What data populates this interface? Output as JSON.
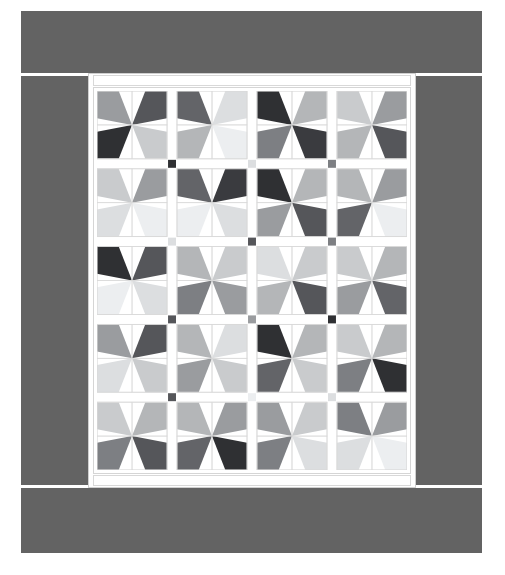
{
  "artwork": {
    "title": "Pinwheel Patchwork Quilt",
    "medium": "quilt photograph",
    "background_color": "#ffffff",
    "border_color": "#636363",
    "sashing_color": "#ffffff",
    "seam_line_color": "#d9d9d9",
    "frame_color": "#ffffff",
    "frame_line_color": "#d2d2d2"
  },
  "layout": {
    "canvas_width": 505,
    "canvas_height": 575,
    "border_strips": [
      {
        "name": "top",
        "x": 21,
        "y": 11,
        "w": 461,
        "h": 62
      },
      {
        "name": "left",
        "x": 21,
        "y": 76,
        "w": 67,
        "h": 409
      },
      {
        "name": "right",
        "x": 416,
        "y": 76,
        "w": 66,
        "h": 409
      },
      {
        "name": "bottom",
        "x": 21,
        "y": 488,
        "w": 461,
        "h": 65
      }
    ],
    "quilt_frame": {
      "x": 88,
      "y": 73,
      "w": 328,
      "h": 415
    },
    "blocks_across": 4,
    "blocks_down": 5,
    "units_per_block": 4,
    "sashing_width": 10,
    "cornerstone_size": 8
  },
  "palette": {
    "near_black": "#2f3033",
    "very_dark": "#3a3b3f",
    "dark": "#55565a",
    "dark_mid": "#636468",
    "mid": "#7d7f83",
    "mid_light": "#9a9c9f",
    "light": "#b4b6b8",
    "lighter": "#c9cbcd",
    "pale": "#dcdee0",
    "very_pale": "#eceef0",
    "white": "#ffffff"
  },
  "chart_data": {
    "type": "heatmap",
    "subtitle": "4 blocks across x 5 blocks down, 4 triangle units per block",
    "xlabel": "block column",
    "ylabel": "block row",
    "legend": [
      {
        "name": "near black",
        "hex": "#2f3033"
      },
      {
        "name": "very dark",
        "hex": "#3a3b3f"
      },
      {
        "name": "dark",
        "hex": "#55565a"
      },
      {
        "name": "dark mid",
        "hex": "#636468"
      },
      {
        "name": "mid",
        "hex": "#7d7f83"
      },
      {
        "name": "mid light",
        "hex": "#9a9c9f"
      },
      {
        "name": "light",
        "hex": "#b4b6b8"
      },
      {
        "name": "lighter",
        "hex": "#c9cbcd"
      },
      {
        "name": "pale",
        "hex": "#dcdee0"
      },
      {
        "name": "very pale",
        "hex": "#eceef0"
      }
    ],
    "blocks": [
      [
        {
          "row": 0,
          "col": 0,
          "units": [
            "#9a9c9f",
            "#55565a",
            "#2f3033",
            "#c9cbcd"
          ]
        },
        {
          "row": 0,
          "col": 1,
          "units": [
            "#636468",
            "#dcdee0",
            "#b4b6b8",
            "#eceef0"
          ]
        },
        {
          "row": 0,
          "col": 2,
          "units": [
            "#2f3033",
            "#b4b6b8",
            "#7d7f83",
            "#3a3b3f"
          ]
        },
        {
          "row": 0,
          "col": 3,
          "units": [
            "#c9cbcd",
            "#9a9c9f",
            "#b4b6b8",
            "#55565a"
          ]
        }
      ],
      [
        {
          "row": 1,
          "col": 0,
          "units": [
            "#c9cbcd",
            "#9a9c9f",
            "#dcdee0",
            "#eceef0"
          ]
        },
        {
          "row": 1,
          "col": 1,
          "units": [
            "#636468",
            "#3a3b3f",
            "#eceef0",
            "#dcdee0"
          ]
        },
        {
          "row": 1,
          "col": 2,
          "units": [
            "#2f3033",
            "#b4b6b8",
            "#9a9c9f",
            "#55565a"
          ]
        },
        {
          "row": 1,
          "col": 3,
          "units": [
            "#b4b6b8",
            "#9a9c9f",
            "#636468",
            "#eceef0"
          ]
        }
      ],
      [
        {
          "row": 2,
          "col": 0,
          "units": [
            "#2f3033",
            "#55565a",
            "#eceef0",
            "#dcdee0"
          ]
        },
        {
          "row": 2,
          "col": 1,
          "units": [
            "#b4b6b8",
            "#c9cbcd",
            "#7d7f83",
            "#9a9c9f"
          ]
        },
        {
          "row": 2,
          "col": 2,
          "units": [
            "#dcdee0",
            "#c9cbcd",
            "#b4b6b8",
            "#55565a"
          ]
        },
        {
          "row": 2,
          "col": 3,
          "units": [
            "#c9cbcd",
            "#b4b6b8",
            "#9a9c9f",
            "#636468"
          ]
        }
      ],
      [
        {
          "row": 3,
          "col": 0,
          "units": [
            "#9a9c9f",
            "#55565a",
            "#dcdee0",
            "#c9cbcd"
          ]
        },
        {
          "row": 3,
          "col": 1,
          "units": [
            "#b4b6b8",
            "#dcdee0",
            "#9a9c9f",
            "#c9cbcd"
          ]
        },
        {
          "row": 3,
          "col": 2,
          "units": [
            "#2f3033",
            "#b4b6b8",
            "#636468",
            "#c9cbcd"
          ]
        },
        {
          "row": 3,
          "col": 3,
          "units": [
            "#c9cbcd",
            "#b4b6b8",
            "#7d7f83",
            "#2f3033"
          ]
        }
      ],
      [
        {
          "row": 4,
          "col": 0,
          "units": [
            "#c9cbcd",
            "#b4b6b8",
            "#7d7f83",
            "#55565a"
          ]
        },
        {
          "row": 4,
          "col": 1,
          "units": [
            "#b4b6b8",
            "#9a9c9f",
            "#636468",
            "#2f3033"
          ]
        },
        {
          "row": 4,
          "col": 2,
          "units": [
            "#9a9c9f",
            "#c9cbcd",
            "#7d7f83",
            "#dcdee0"
          ]
        },
        {
          "row": 4,
          "col": 3,
          "units": [
            "#7d7f83",
            "#9a9c9f",
            "#dcdee0",
            "#eceef0"
          ]
        }
      ]
    ],
    "cornerstones": [
      {
        "row": 0,
        "col": 0,
        "hex": "#2f3033"
      },
      {
        "row": 0,
        "col": 1,
        "hex": "#dcdee0"
      },
      {
        "row": 0,
        "col": 2,
        "hex": "#7d7f83"
      },
      {
        "row": 1,
        "col": 0,
        "hex": "#dcdee0"
      },
      {
        "row": 1,
        "col": 1,
        "hex": "#55565a"
      },
      {
        "row": 1,
        "col": 2,
        "hex": "#7d7f83"
      },
      {
        "row": 2,
        "col": 0,
        "hex": "#55565a"
      },
      {
        "row": 2,
        "col": 1,
        "hex": "#9a9c9f"
      },
      {
        "row": 2,
        "col": 2,
        "hex": "#2f3033"
      },
      {
        "row": 3,
        "col": 0,
        "hex": "#55565a"
      },
      {
        "row": 3,
        "col": 1,
        "hex": "#eceef0"
      },
      {
        "row": 3,
        "col": 2,
        "hex": "#dcdee0"
      }
    ]
  }
}
